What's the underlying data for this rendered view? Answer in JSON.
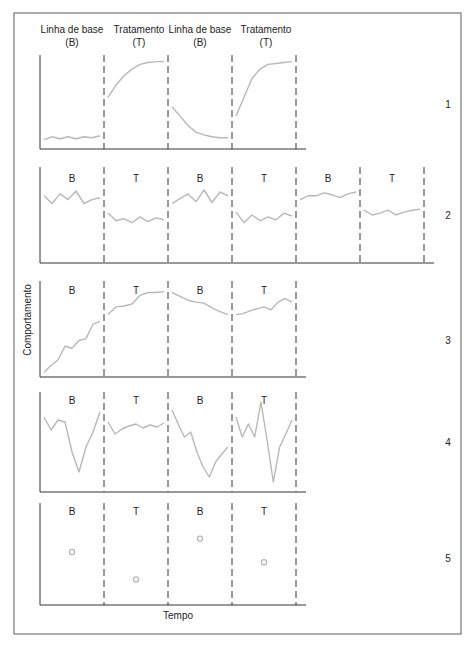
{
  "figure": {
    "ylabel": "Comportamento",
    "xlabel": "Tempo",
    "header_labels": [
      {
        "line1": "Linha de base",
        "line2": "(B)"
      },
      {
        "line1": "Tratamento",
        "line2": "(T)"
      },
      {
        "line1": "Linha de base",
        "line2": "(B)"
      },
      {
        "line1": "Tratamento",
        "line2": "(T)"
      }
    ],
    "line_color": "#b8b8b8",
    "axis_color": "#333333"
  },
  "chart_data": {
    "type": "line",
    "title": "",
    "xlabel": "Tempo",
    "ylabel": "Comportamento",
    "grid": false,
    "phase_legend": {
      "B": "Linha de base",
      "T": "Tratamento"
    },
    "panels": [
      {
        "id": "1",
        "phases": [
          "B",
          "T",
          "B",
          "T"
        ],
        "phase_labels": [
          "Linha de base (B)",
          "Tratamento (T)",
          "Linha de base (B)",
          "Tratamento (T)"
        ],
        "description": "Baseline low and flat; treatment rises and plateaus; withdrawal baseline declines; treatment rises again",
        "series": [
          {
            "phase": "B",
            "values": [
              0.1,
              0.13,
              0.11,
              0.13,
              0.11,
              0.13,
              0.12,
              0.14
            ]
          },
          {
            "phase": "T",
            "values": [
              0.55,
              0.68,
              0.78,
              0.85,
              0.9,
              0.92,
              0.93,
              0.93
            ]
          },
          {
            "phase": "B",
            "values": [
              0.45,
              0.35,
              0.25,
              0.18,
              0.15,
              0.13,
              0.12,
              0.12
            ]
          },
          {
            "phase": "T",
            "values": [
              0.35,
              0.55,
              0.75,
              0.85,
              0.9,
              0.91,
              0.92,
              0.93
            ]
          }
        ]
      },
      {
        "id": "2",
        "phases": [
          "B",
          "T",
          "B",
          "T",
          "B",
          "T"
        ],
        "description": "Baseline levels higher than treatment levels across three alternations, both variable",
        "series": [
          {
            "phase": "B",
            "values": [
              0.7,
              0.62,
              0.72,
              0.66,
              0.75,
              0.62,
              0.66,
              0.68
            ]
          },
          {
            "phase": "T",
            "values": [
              0.52,
              0.44,
              0.46,
              0.42,
              0.48,
              0.43,
              0.47,
              0.45
            ]
          },
          {
            "phase": "B",
            "values": [
              0.62,
              0.67,
              0.72,
              0.64,
              0.76,
              0.63,
              0.74,
              0.7
            ]
          },
          {
            "phase": "T",
            "values": [
              0.53,
              0.42,
              0.5,
              0.44,
              0.48,
              0.45,
              0.52,
              0.49
            ]
          },
          {
            "phase": "B",
            "values": [
              0.66,
              0.7,
              0.7,
              0.73,
              0.71,
              0.68,
              0.72,
              0.74
            ]
          },
          {
            "phase": "T",
            "values": [
              0.55,
              0.5,
              0.52,
              0.55,
              0.5,
              0.53,
              0.55,
              0.56
            ]
          }
        ]
      },
      {
        "id": "3",
        "phases": [
          "B",
          "T",
          "B",
          "T"
        ],
        "description": "Baseline rising trend continues into treatment; second baseline declines slowly; treatment rises slightly",
        "series": [
          {
            "phase": "B",
            "values": [
              0.05,
              0.12,
              0.18,
              0.32,
              0.3,
              0.38,
              0.4,
              0.55,
              0.58
            ]
          },
          {
            "phase": "T",
            "values": [
              0.65,
              0.73,
              0.74,
              0.76,
              0.85,
              0.88,
              0.88,
              0.89
            ]
          },
          {
            "phase": "B",
            "values": [
              0.88,
              0.84,
              0.8,
              0.78,
              0.77,
              0.72,
              0.68,
              0.65
            ]
          },
          {
            "phase": "T",
            "values": [
              0.65,
              0.66,
              0.69,
              0.71,
              0.73,
              0.7,
              0.78,
              0.82,
              0.78
            ]
          }
        ]
      },
      {
        "id": "4",
        "phases": [
          "B",
          "T",
          "B",
          "T"
        ],
        "description": "Highly variable data: baseline with deep dip; treatment stable; baseline with dip; treatment with large spike and dip",
        "series": [
          {
            "phase": "B",
            "values": [
              0.75,
              0.62,
              0.72,
              0.7,
              0.4,
              0.2,
              0.45,
              0.6,
              0.8
            ]
          },
          {
            "phase": "T",
            "values": [
              0.7,
              0.58,
              0.63,
              0.66,
              0.68,
              0.64,
              0.67,
              0.65,
              0.69
            ]
          },
          {
            "phase": "B",
            "values": [
              0.82,
              0.68,
              0.55,
              0.6,
              0.4,
              0.25,
              0.15,
              0.3,
              0.38,
              0.45
            ]
          },
          {
            "phase": "T",
            "values": [
              0.75,
              0.55,
              0.68,
              0.55,
              0.9,
              0.52,
              0.1,
              0.45,
              0.58,
              0.72
            ]
          }
        ]
      },
      {
        "id": "5",
        "phases": [
          "B",
          "T",
          "B",
          "T"
        ],
        "description": "Single data point per phase",
        "series": [
          {
            "phase": "B",
            "values": [
              0.52
            ]
          },
          {
            "phase": "T",
            "values": [
              0.25
            ]
          },
          {
            "phase": "B",
            "values": [
              0.65
            ]
          },
          {
            "phase": "T",
            "values": [
              0.42
            ]
          }
        ]
      }
    ]
  }
}
